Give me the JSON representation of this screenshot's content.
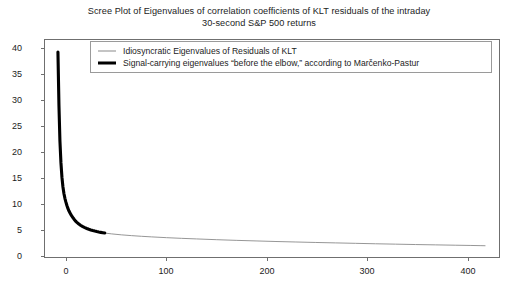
{
  "figure": {
    "title_lines": [
      "Scree Plot of Eigenvalues of correlation coefficients of KLT residuals of the intraday",
      "30-second S&P 500 returns"
    ],
    "background_color": "#ffffff",
    "frame_color": "#6f6f6f"
  },
  "legend": {
    "position": "upper-center",
    "entries": [
      {
        "label": "Idiosyncratic Eigenvalues of Residuals of KLT",
        "marker": "thin-line",
        "color": "#8a8a8a"
      },
      {
        "label": "Signal-carrying eigenvalues “before the elbow,” according to Marčenko-Pastur",
        "marker": "thick-line",
        "color": "#000000"
      }
    ]
  },
  "chart_data": {
    "type": "line",
    "title": "Scree Plot of Eigenvalues of correlation coefficients of KLT residuals of the intraday 30-second S&P 500 returns",
    "xlabel": "",
    "ylabel": "",
    "xlim": [
      -12,
      444
    ],
    "ylim": [
      -1.6,
      43.5
    ],
    "xticks": [
      0,
      100,
      200,
      300,
      400
    ],
    "yticks": [
      0,
      5,
      10,
      15,
      20,
      25,
      30,
      35,
      40
    ],
    "grid": false,
    "legend_position": "upper center",
    "series": [
      {
        "name": "Signal-carrying eigenvalues “before the elbow,” according to Marčenko-Pastur",
        "color": "#000000",
        "linewidth": 3.0,
        "x": [
          1,
          2,
          3,
          4,
          5,
          6,
          7,
          8,
          9,
          10,
          11,
          12,
          13,
          14,
          15,
          16,
          17,
          18,
          19,
          20,
          22,
          24,
          26,
          28,
          30,
          32,
          34,
          36,
          38,
          40,
          42,
          44,
          46,
          48
        ],
        "values": [
          41.0,
          30.0,
          22.5,
          18.0,
          15.0,
          13.0,
          11.6,
          10.6,
          9.8,
          9.1,
          8.5,
          8.0,
          7.6,
          7.2,
          6.9,
          6.6,
          6.3,
          6.05,
          5.8,
          5.6,
          5.25,
          4.95,
          4.7,
          4.5,
          4.32,
          4.16,
          4.02,
          3.9,
          3.79,
          3.69,
          3.6,
          3.52,
          3.45,
          3.38
        ]
      },
      {
        "name": "Idiosyncratic Eigenvalues of Residuals of KLT",
        "color": "#8a8a8a",
        "linewidth": 0.8,
        "x": [
          48,
          55,
          65,
          75,
          85,
          95,
          110,
          125,
          140,
          160,
          180,
          200,
          220,
          240,
          260,
          280,
          300,
          320,
          340,
          360,
          380,
          400,
          415,
          425,
          430
        ],
        "values": [
          3.38,
          3.2,
          3.0,
          2.84,
          2.7,
          2.58,
          2.42,
          2.28,
          2.16,
          2.0,
          1.86,
          1.74,
          1.62,
          1.52,
          1.42,
          1.33,
          1.24,
          1.15,
          1.07,
          0.99,
          0.92,
          0.85,
          0.8,
          0.76,
          0.74
        ]
      }
    ],
    "elbow_index": 48,
    "max_eigenvalue": 41.0
  }
}
